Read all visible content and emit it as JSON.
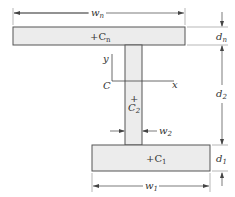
{
  "diagram": {
    "colors": {
      "fill": "#ececec",
      "stroke": "#555555",
      "line": "#444444",
      "text": "#333333"
    },
    "top_flange": {
      "centroid_label": "+C",
      "centroid_sub": "n",
      "width_label": "w",
      "width_sub": "n",
      "depth_label": "d",
      "depth_sub": "n"
    },
    "web": {
      "centroid_plus": "+",
      "centroid_label": "C",
      "centroid_sub": "2",
      "width_label": "w",
      "width_sub": "2",
      "depth_label": "d",
      "depth_sub": "2"
    },
    "bottom_flange": {
      "centroid_label": "+C",
      "centroid_sub": "1",
      "width_label": "w",
      "width_sub": "1",
      "depth_label": "d",
      "depth_sub": "1"
    },
    "axes": {
      "origin_label": "C",
      "x_label": "x",
      "y_label": "y"
    }
  }
}
